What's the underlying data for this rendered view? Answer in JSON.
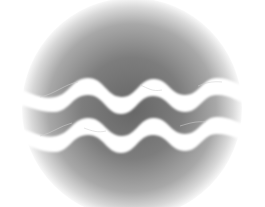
{
  "icon": {
    "name": "water-waves-circle",
    "shape": "circle",
    "waves": 2,
    "colors": {
      "background": "#ffffff",
      "circle_center": "#6e6e6e",
      "circle_mid": "#9a9a9a",
      "circle_edge": "#ffffff",
      "wave": "#ffffff"
    }
  }
}
